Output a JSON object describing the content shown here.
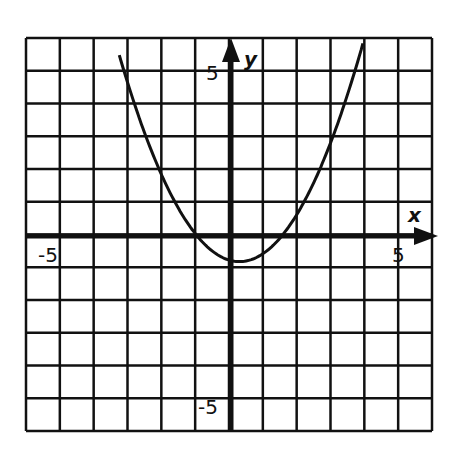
{
  "chart_data": {
    "type": "line",
    "title": "",
    "xlabel": "x",
    "ylabel": "y",
    "xlim": [
      -6,
      6
    ],
    "ylim": [
      -6,
      6
    ],
    "grid": true,
    "tick_labels": {
      "x": [
        "-5",
        "5"
      ],
      "y": [
        "5",
        "-5"
      ]
    },
    "series": [
      {
        "name": "parabola",
        "equation": "y = 0.5x^2 - 0.25x - 0.75",
        "x": [
          -3.1,
          -3,
          -2,
          -1,
          0,
          0.25,
          1,
          1.5,
          2,
          3,
          4
        ],
        "values": [
          6.0,
          4.5,
          1.75,
          0,
          -0.75,
          -0.78,
          -0.5,
          0,
          0.75,
          3.0,
          6.25
        ]
      }
    ]
  },
  "labels": {
    "x_axis": "x",
    "y_axis": "y",
    "x_min": "-5",
    "x_max": "5",
    "y_max": "5",
    "y_min": "-5"
  }
}
